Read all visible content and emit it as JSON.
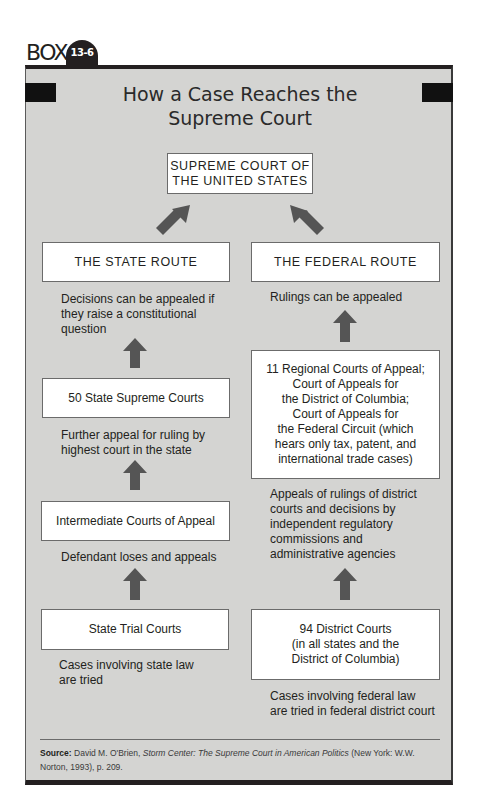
{
  "header": {
    "box_label": "BOX",
    "box_number": "13-6"
  },
  "title": {
    "line1": "How a Case Reaches the",
    "line2": "Supreme Court"
  },
  "top_node": {
    "label": "SUPREME COURT OF\nTHE UNITED STATES"
  },
  "state_route": {
    "heading": "THE STATE ROUTE",
    "heading_note": "Decisions can be appealed if\nthey raise a constitutional\nquestion",
    "levels": [
      {
        "label": "50 State Supreme Courts",
        "note": "Further appeal for ruling by\nhighest court in the state"
      },
      {
        "label": "Intermediate Courts of Appeal",
        "note": "Defendant loses and appeals"
      },
      {
        "label": "State Trial Courts",
        "note": "Cases involving state law\nare tried"
      }
    ]
  },
  "federal_route": {
    "heading": "THE FEDERAL ROUTE",
    "heading_note": "Rulings can be appealed",
    "levels": [
      {
        "label": "11 Regional Courts of Appeal;\nCourt of Appeals for\nthe District of Columbia;\nCourt of Appeals for\nthe Federal Circuit (which\nhears only tax, patent, and\ninternational trade cases)",
        "note": "Appeals of rulings of district\ncourts and decisions by\nindependent regulatory\ncommissions and\nadministrative agencies"
      },
      {
        "label": "94 District Courts\n(in all states and the\nDistrict of Columbia)",
        "note": "Cases involving federal law\nare tried in federal district court"
      }
    ]
  },
  "source": {
    "label": "Source:",
    "author": "David M. O'Brien,",
    "book_title": "Storm Center: The Supreme Court in American Politics",
    "publication": "(New York: W.W. Norton, 1993), p. 209."
  },
  "colors": {
    "panel_background": "#d4d4d2",
    "frame_dark": "#231f20",
    "arrow": "#555555",
    "node_background": "#ffffff"
  }
}
